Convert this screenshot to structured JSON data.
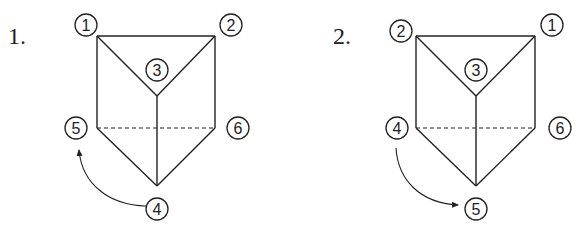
{
  "figures": [
    {
      "number": "1.",
      "labels": {
        "top_left": "1",
        "top_right": "2",
        "center_top": "3",
        "mid_left": "5",
        "mid_right": "6",
        "bottom": "4"
      },
      "arrow": {
        "from": "4",
        "to": "5"
      }
    },
    {
      "number": "2.",
      "labels": {
        "top_left": "2",
        "top_right": "1",
        "center_top": "3",
        "mid_left": "4",
        "mid_right": "6",
        "bottom": "5"
      },
      "arrow": {
        "from": "4",
        "to": "5"
      }
    }
  ]
}
